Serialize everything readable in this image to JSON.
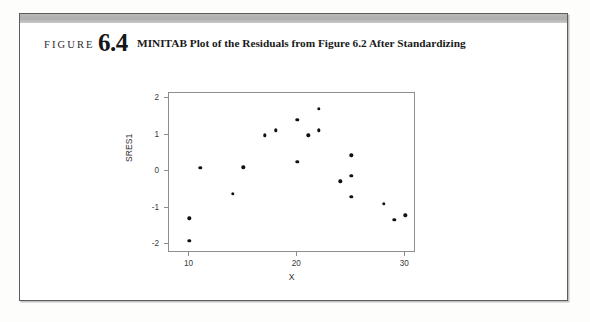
{
  "figure": {
    "label_word": "FIGURE",
    "number": "6.4",
    "title": "MINITAB Plot of the Residuals from Figure 6.2 After Standardizing"
  },
  "colors": {
    "point": "#111111",
    "frame": "#8e8e8e",
    "band": "#b9b9b9",
    "page_border": "#5d5d5d",
    "text": "#1a1a1a"
  },
  "chart_data": {
    "type": "scatter",
    "title": "MINITAB Plot of the Residuals from Figure 6.2 After Standardizing",
    "xlabel": "X",
    "ylabel": "SRES1",
    "xlim": [
      8.1,
      31.0
    ],
    "ylim": [
      -2.25,
      2.15
    ],
    "xticks": [
      10,
      20,
      30
    ],
    "xtick_labels": [
      "10",
      "20",
      "30"
    ],
    "yticks": [
      2,
      1,
      0,
      -1,
      -2
    ],
    "ytick_labels": [
      "2",
      "1",
      "0",
      "-1",
      "-2"
    ],
    "grid": false,
    "legend": null,
    "points": [
      {
        "x": 10.0,
        "y": -1.92
      },
      {
        "x": 10.0,
        "y": -1.3
      },
      {
        "x": 11.0,
        "y": 0.1
      },
      {
        "x": 14.0,
        "y": -0.63
      },
      {
        "x": 15.0,
        "y": 0.11
      },
      {
        "x": 17.0,
        "y": 0.99
      },
      {
        "x": 18.0,
        "y": 1.12
      },
      {
        "x": 20.0,
        "y": 1.42
      },
      {
        "x": 20.0,
        "y": 0.26
      },
      {
        "x": 21.0,
        "y": 0.99
      },
      {
        "x": 22.0,
        "y": 1.71
      },
      {
        "x": 22.0,
        "y": 1.12
      },
      {
        "x": 24.0,
        "y": -0.28
      },
      {
        "x": 25.0,
        "y": 0.44
      },
      {
        "x": 25.0,
        "y": -0.13
      },
      {
        "x": 25.0,
        "y": -0.71
      },
      {
        "x": 28.0,
        "y": -0.89
      },
      {
        "x": 29.0,
        "y": -1.34
      },
      {
        "x": 30.0,
        "y": -1.21
      }
    ]
  }
}
